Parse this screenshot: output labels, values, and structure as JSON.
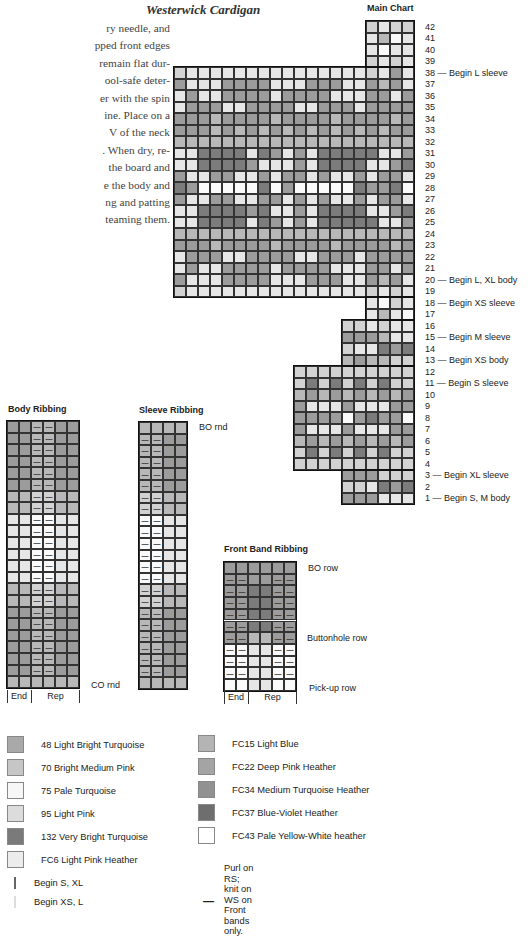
{
  "page": {
    "title": "Westerwick Cardigan",
    "body_text_lines": [
      "ry needle, and",
      "pped front edges",
      "remain flat dur-",
      "ool-safe deter-",
      "er with the spin",
      "ine. Place on a",
      "V of the neck",
      ". When dry, re-",
      "the board and",
      "e the body and",
      "ng and patting",
      "teaming them."
    ]
  },
  "shades": {
    "0": "#fafafa",
    "1": "#e6e6e6",
    "2": "#d2d2d2",
    "3": "#b8b8b8",
    "4": "#9c9c9c",
    "5": "#7c7c7c"
  },
  "main_chart": {
    "title": "Main Chart",
    "columns": 20,
    "rows": [
      {
        "n": 42,
        "start": 16,
        "cells": "2122",
        "label": "42"
      },
      {
        "n": 41,
        "start": 16,
        "cells": "1301",
        "label": "41"
      },
      {
        "n": 40,
        "start": 16,
        "cells": "1011",
        "label": "40"
      },
      {
        "n": 39,
        "start": 16,
        "cells": "2121",
        "label": "39"
      },
      {
        "n": 38,
        "start": 0,
        "cells": "21111111111111112141",
        "label": "38 — Begin L sleeve"
      },
      {
        "n": 37,
        "start": 0,
        "cells": "41114444111444114341",
        "label": "37"
      },
      {
        "n": 36,
        "start": 0,
        "cells": "14114444144441114414",
        "label": "36"
      },
      {
        "n": 35,
        "start": 0,
        "cells": "14441144441144414444",
        "label": "35"
      },
      {
        "n": 34,
        "start": 0,
        "cells": "44434444344443444434",
        "label": "34"
      },
      {
        "n": 33,
        "start": 0,
        "cells": "44434343434343434344",
        "label": "33"
      },
      {
        "n": 32,
        "start": 0,
        "cells": "33333333333333333333",
        "label": "32"
      },
      {
        "n": 31,
        "start": 0,
        "cells": "11555515414155555114",
        "label": "31"
      },
      {
        "n": 30,
        "start": 0,
        "cells": "11555541114155551145",
        "label": "30"
      },
      {
        "n": 29,
        "start": 0,
        "cells": "41144114144141141441",
        "label": "29"
      },
      {
        "n": 28,
        "start": 0,
        "cells": "54000005040000054450",
        "label": "28"
      },
      {
        "n": 27,
        "start": 0,
        "cells": "41144114414141141441",
        "label": "27"
      },
      {
        "n": 26,
        "start": 0,
        "cells": "11555545114155551145",
        "label": "26"
      },
      {
        "n": 25,
        "start": 0,
        "cells": "11555515414155555114",
        "label": "25"
      },
      {
        "n": 24,
        "start": 0,
        "cells": "33333333333333333333",
        "label": "24"
      },
      {
        "n": 23,
        "start": 0,
        "cells": "44434444344443444434",
        "label": "23"
      },
      {
        "n": 22,
        "start": 0,
        "cells": "14441144441144414444",
        "label": "22"
      },
      {
        "n": 21,
        "start": 0,
        "cells": "14114444144441114414",
        "label": "21"
      },
      {
        "n": 20,
        "start": 0,
        "cells": "41114444111444114341",
        "label": "20 — Begin L, XL body"
      },
      {
        "n": 19,
        "start": 0,
        "cells": "21111111111111112121",
        "label": "19"
      },
      {
        "n": 18,
        "start": 16,
        "cells": "1021",
        "label": "18 — Begin XS sleeve"
      },
      {
        "n": 17,
        "start": 16,
        "cells": "1310",
        "label": "17"
      },
      {
        "n": 16,
        "start": 14,
        "cells": "221211",
        "label": "16"
      },
      {
        "n": 15,
        "start": 14,
        "cells": "444311",
        "label": "15 — Begin M sleeve"
      },
      {
        "n": 14,
        "start": 14,
        "cells": "211545",
        "label": "14"
      },
      {
        "n": 13,
        "start": 14,
        "cells": "343322",
        "label": "13 — Begin XS body"
      },
      {
        "n": 12,
        "start": 10,
        "cells": "2222222222",
        "label": "12"
      },
      {
        "n": 11,
        "start": 10,
        "cells": "2525252522",
        "label": "11 — Begin S sleeve"
      },
      {
        "n": 10,
        "start": 10,
        "cells": "3434343434",
        "label": "10"
      },
      {
        "n": 9,
        "start": 10,
        "cells": "4111411144",
        "label": "9"
      },
      {
        "n": 8,
        "start": 10,
        "cells": "4444045440",
        "label": "8"
      },
      {
        "n": 7,
        "start": 10,
        "cells": "4111411144",
        "label": "7"
      },
      {
        "n": 6,
        "start": 10,
        "cells": "3434343434",
        "label": "6"
      },
      {
        "n": 5,
        "start": 10,
        "cells": "2525252522",
        "label": "5"
      },
      {
        "n": 4,
        "start": 10,
        "cells": "2222222222",
        "label": "4"
      },
      {
        "n": 3,
        "start": 14,
        "cells": "444222",
        "label": "3 — Begin XL sleeve"
      },
      {
        "n": 2,
        "start": 14,
        "cells": "221545",
        "label": "2"
      },
      {
        "n": 1,
        "start": 14,
        "cells": "444111",
        "label": "1 — Begin S, M body"
      }
    ]
  },
  "body_ribbing": {
    "title": "Body Ribbing",
    "columns": 6,
    "dash_columns": [
      2,
      3
    ],
    "rows": [
      "443344",
      "443344",
      "443344",
      "443344",
      "443344",
      "443344",
      "332233",
      "332233",
      "110011",
      "110011",
      "110011",
      "110011",
      "110011",
      "110011",
      "332233",
      "332233",
      "443344",
      "443344",
      "443344",
      "443344",
      "443344",
      "443344",
      "333333"
    ],
    "dash_rows": [
      0,
      1,
      2,
      3,
      4,
      5,
      6,
      7,
      8,
      9,
      10,
      11,
      12,
      13,
      14,
      15,
      16,
      17,
      18,
      19,
      20,
      21
    ],
    "bottom_label": "CO rnd",
    "footer": {
      "end": "End",
      "rep": "Rep"
    }
  },
  "sleeve_ribbing": {
    "title": "Sleeve Ribbing",
    "columns": 4,
    "dash_columns": [
      0,
      1
    ],
    "rows": [
      "3333",
      "3344",
      "3344",
      "3344",
      "3344",
      "3344",
      "2233",
      "2233",
      "0011",
      "0011",
      "0011",
      "0011",
      "0011",
      "0011",
      "2233",
      "2233",
      "3344",
      "3344",
      "3344",
      "3344",
      "3344",
      "3344",
      "3333"
    ],
    "dash_rows": [
      1,
      2,
      3,
      4,
      5,
      6,
      7,
      8,
      9,
      10,
      11,
      12,
      13,
      14,
      15,
      16,
      17,
      18,
      19,
      20,
      21
    ],
    "top_label": "BO rnd"
  },
  "front_band_ribbing": {
    "title": "Front Band Ribbing",
    "columns": 6,
    "dash_columns": [
      0,
      1,
      4,
      5
    ],
    "rows": [
      "444444",
      "444444",
      "445544",
      "445544",
      "445544",
      "445544",
      "443344",
      "001100",
      "001100",
      "001100",
      "001100"
    ],
    "dash_rows": [
      1,
      2,
      3,
      4,
      5,
      6,
      7,
      8,
      9
    ],
    "labels": {
      "bo": "BO row",
      "buttonhole": "Buttonhole row",
      "pickup": "Pick-up row"
    },
    "footer": {
      "end": "End",
      "rep": "Rep"
    }
  },
  "legend": {
    "left": [
      {
        "swatch": "#a9a9a9",
        "label": "48 Light Bright Turquoise"
      },
      {
        "swatch": "#c6c6c6",
        "label": "70 Bright Medium Pink"
      },
      {
        "swatch": "#f7f7f7",
        "label": "75 Pale Turquoise"
      },
      {
        "swatch": "#dcdcdc",
        "label": "95 Light Pink"
      },
      {
        "swatch": "#7a7a7a",
        "label": "132 Very Bright Turquoise"
      },
      {
        "swatch": "#ececec",
        "label": "FC6 Light Pink Heather"
      }
    ],
    "right": [
      {
        "swatch": "#b4b4b4",
        "label": "FC15 Light Blue"
      },
      {
        "swatch": "#a4a4a4",
        "label": "FC22 Deep Pink Heather"
      },
      {
        "swatch": "#919191",
        "label": "FC34 Medium Turquoise Heather"
      },
      {
        "swatch": "#6e6e6e",
        "label": "FC37 Blue-Violet Heather"
      },
      {
        "swatch": "#ffffff",
        "label": "FC43 Pale Yellow-White heather"
      }
    ],
    "line_keys": [
      {
        "style": "dark",
        "label": "Begin S, XL"
      },
      {
        "style": "light",
        "label": "Begin XS, L"
      }
    ],
    "purl_key": {
      "symbol": "—",
      "lines": [
        "Purl on RS;",
        "knit on WS on",
        "Front bands only."
      ]
    }
  }
}
